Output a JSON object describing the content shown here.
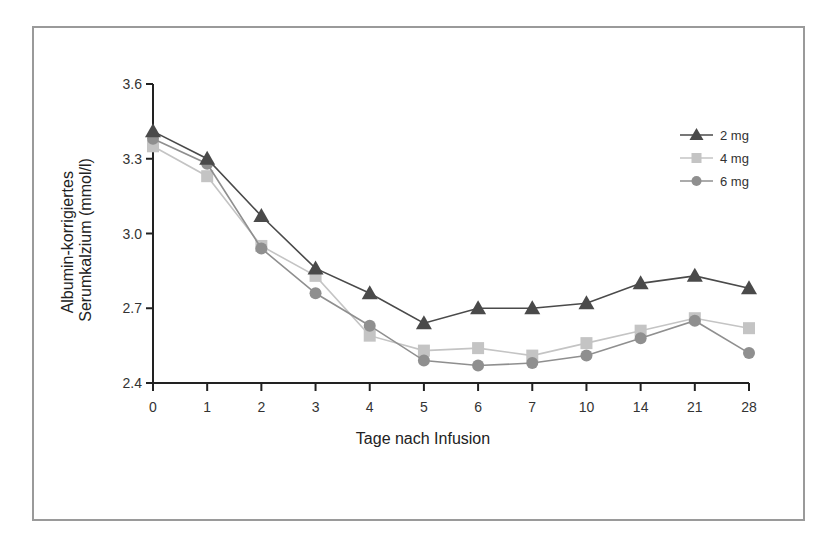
{
  "chart_data": {
    "type": "line",
    "title": "",
    "xlabel": "Tage nach Infusion",
    "ylabel_lines": [
      "Albumin-korrigiertes",
      "Serumkalzium (mmol/l)"
    ],
    "ylabel": "Albumin-korrigiertes Serumkalzium (mmol/l)",
    "categories": [
      "0",
      "1",
      "2",
      "3",
      "4",
      "5",
      "6",
      "7",
      "10",
      "14",
      "21",
      "28"
    ],
    "yticks": [
      2.4,
      2.7,
      3.0,
      3.3,
      3.6
    ],
    "ytick_labels": [
      "2.4",
      "2.7",
      "3.0",
      "3.3",
      "3.6"
    ],
    "ylim": [
      2.4,
      3.6
    ],
    "grid": false,
    "legend_position": "upper right",
    "series": [
      {
        "name": "2 mg",
        "marker": "triangle",
        "color": "#4a4a4a",
        "values": [
          3.41,
          3.3,
          3.07,
          2.86,
          2.76,
          2.64,
          2.7,
          2.7,
          2.72,
          2.8,
          2.83,
          2.78
        ]
      },
      {
        "name": "4 mg",
        "marker": "square",
        "color": "#c4c4c4",
        "values": [
          3.35,
          3.23,
          2.95,
          2.83,
          2.59,
          2.53,
          2.54,
          2.51,
          2.56,
          2.61,
          2.66,
          2.62
        ]
      },
      {
        "name": "6 mg",
        "marker": "circle",
        "color": "#8f8f8f",
        "values": [
          3.38,
          3.28,
          2.94,
          2.76,
          2.63,
          2.49,
          2.47,
          2.48,
          2.51,
          2.58,
          2.65,
          2.52
        ]
      }
    ]
  }
}
